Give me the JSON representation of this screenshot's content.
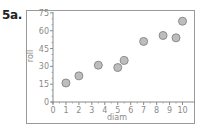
{
  "figure_label": "5a.",
  "chart_data": {
    "type": "scatter",
    "title": "",
    "xlabel": "diam",
    "ylabel": "roll",
    "xlim": [
      0,
      10.6
    ],
    "ylim": [
      0,
      75
    ],
    "x_ticks": [
      0,
      1,
      2,
      3,
      4,
      5,
      6,
      7,
      8,
      9,
      10
    ],
    "y_ticks": [
      0,
      15,
      30,
      45,
      60,
      75
    ],
    "grid": false,
    "legend": null,
    "points": [
      {
        "x": 1,
        "y": 16
      },
      {
        "x": 2,
        "y": 22
      },
      {
        "x": 3.5,
        "y": 31
      },
      {
        "x": 5,
        "y": 29
      },
      {
        "x": 5.5,
        "y": 35
      },
      {
        "x": 7,
        "y": 51
      },
      {
        "x": 8.5,
        "y": 56
      },
      {
        "x": 9.5,
        "y": 54
      },
      {
        "x": 10,
        "y": 68
      }
    ],
    "marker": {
      "fill": "#bdbdbd",
      "stroke": "#8c8c8c",
      "radius": 4
    }
  },
  "colors": {
    "frame": "#9a9a9a",
    "axis": "#8a8a8a",
    "text": "#8a8a8a",
    "label": "#222222"
  }
}
